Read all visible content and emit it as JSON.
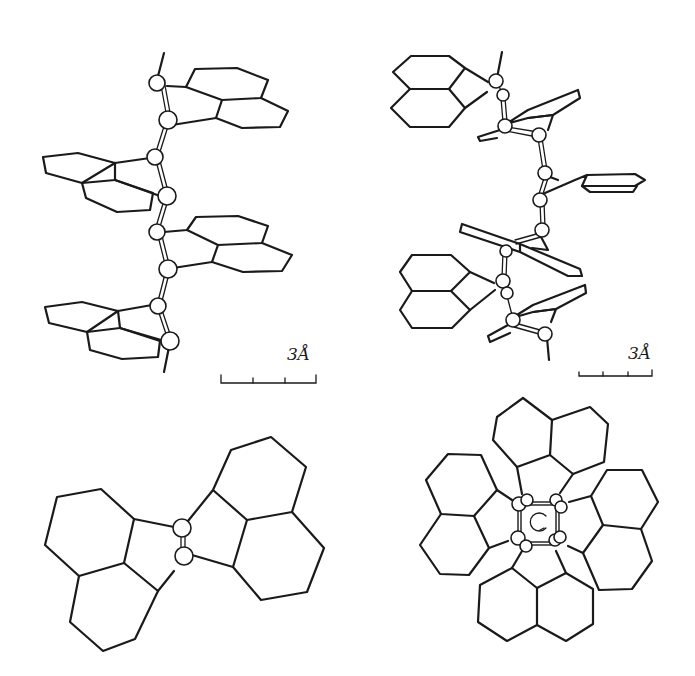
{
  "figure": {
    "panels": [
      {
        "id": "top-left",
        "description": "side view of helical polymer chain with fused-ring pendant groups",
        "scale_label": "3Å"
      },
      {
        "id": "top-right",
        "description": "perspective view of helical polymer chain with fused-ring pendant groups",
        "scale_label": "3Å"
      },
      {
        "id": "bottom-left",
        "description": "end-on view of two adjacent monomer units"
      },
      {
        "id": "bottom-right",
        "description": "end-on view down helix axis showing four pendant groups around backbone"
      }
    ],
    "colors": {
      "line": "#1a1a1a",
      "background": "#ffffff"
    }
  }
}
